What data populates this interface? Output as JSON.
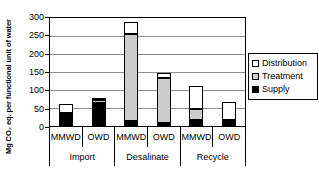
{
  "chart_data": {
    "type": "bar",
    "stacked": true,
    "title": "",
    "ylabel": "Mg CO₂ eq. per functional unit of water",
    "xlabel": "",
    "ylim": [
      0,
      300
    ],
    "yticks": [
      0,
      50,
      100,
      150,
      200,
      250,
      300
    ],
    "grid": true,
    "groups": [
      "Import",
      "Desalinate",
      "Recycle"
    ],
    "categories": [
      "MMWD",
      "OWD",
      "MMWD",
      "OWD",
      "MMWD",
      "OWD"
    ],
    "series": [
      {
        "name": "Supply",
        "color": "#000000",
        "values": [
          37,
          64,
          15,
          9,
          18,
          10
        ]
      },
      {
        "name": "Treatment",
        "color": "#cccccc",
        "values": [
          0,
          8,
          240,
          124,
          30,
          7
        ]
      },
      {
        "name": "Distribution",
        "color": "#ffffff",
        "values": [
          24,
          4,
          35,
          13,
          64,
          51
        ]
      }
    ],
    "totals": [
      61,
      76,
      290,
      146,
      112,
      68
    ],
    "legend": {
      "position": "right",
      "items": [
        "Distribution",
        "Treatment",
        "Supply"
      ]
    }
  },
  "colors": {
    "axis": "#000000",
    "gridline": "#8c8c8c",
    "background": "#ffffff"
  }
}
